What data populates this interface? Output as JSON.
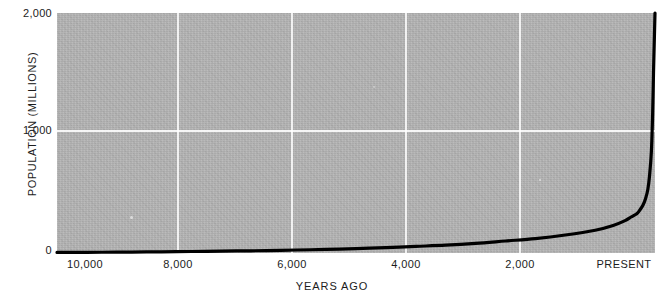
{
  "chart_data": {
    "type": "line",
    "title": "",
    "xlabel": "YEARS AGO",
    "ylabel": "POPULATION  (MILLIONS)",
    "xlim": [
      10000,
      0
    ],
    "ylim": [
      0,
      2000
    ],
    "x_ticks": [
      "10,000",
      "8,000",
      "6,000",
      "4,000",
      "2,000",
      "PRESENT"
    ],
    "x_tick_values": [
      10000,
      8000,
      6000,
      4000,
      2000,
      0
    ],
    "y_ticks": [
      "2,000",
      "1,000",
      "0"
    ],
    "y_tick_values": [
      2000,
      1000,
      0
    ],
    "grid": true,
    "legend": "none",
    "series": [
      {
        "name": "World population",
        "x": [
          10000,
          9500,
          9000,
          8500,
          8000,
          7500,
          7000,
          6500,
          6000,
          5500,
          5000,
          4500,
          4000,
          3500,
          3000,
          2500,
          2000,
          1500,
          1000,
          700,
          500,
          400,
          300,
          250,
          200,
          160,
          120,
          90,
          60,
          40,
          25,
          10,
          0
        ],
        "values": [
          5,
          6,
          7,
          9,
          11,
          14,
          17,
          20,
          25,
          30,
          37,
          45,
          55,
          65,
          80,
          100,
          120,
          150,
          190,
          230,
          270,
          300,
          330,
          360,
          400,
          450,
          530,
          650,
          850,
          1150,
          1500,
          1800,
          2000
        ]
      }
    ]
  },
  "axes": {
    "y_title": "POPULATION  (MILLIONS)",
    "x_title": "YEARS AGO",
    "y_labels": [
      {
        "text": "2,000",
        "value": 2000
      },
      {
        "text": "1,000",
        "value": 1000
      },
      {
        "text": "0",
        "value": 0
      }
    ],
    "x_labels": [
      {
        "text": "10,000",
        "value": 10000
      },
      {
        "text": "8,000",
        "value": 8000
      },
      {
        "text": "6,000",
        "value": 6000
      },
      {
        "text": "4,000",
        "value": 4000
      },
      {
        "text": "2,000",
        "value": 2000
      },
      {
        "text": "PRESENT",
        "value": 0
      }
    ]
  },
  "style": {
    "plot_background": "#b4b4b4",
    "grid_color": "#ffffff",
    "curve_color": "#000000",
    "page_background": "#ffffff",
    "text_color": "#1c1c1c"
  }
}
